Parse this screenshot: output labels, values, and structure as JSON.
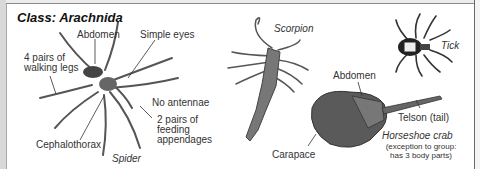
{
  "title": "Class: Arachnida",
  "spider": {
    "name": "Spider",
    "labels": {
      "abdomen": "Abdomen",
      "simple_eyes": "Simple eyes",
      "walking_legs_line1": "4 pairs of",
      "walking_legs_line2": "walking legs",
      "no_antennae": "No antennae",
      "feeding_line1": "2 pairs of",
      "feeding_line2": "feeding",
      "feeding_line3": "appendages",
      "cephalothorax": "Cephalothorax"
    }
  },
  "scorpion": {
    "name": "Scorpion"
  },
  "tick": {
    "name": "Tick"
  },
  "horseshoe_crab": {
    "name": "Horseshoe crab",
    "note_line1": "(exception to group:",
    "note_line2": "has 3 body parts)",
    "labels": {
      "abdomen": "Abdomen",
      "telson": "Telson (tail)",
      "carapace": "Carapace"
    }
  },
  "colors": {
    "frame": "#d9d9d9",
    "border": "#8a8a8a",
    "text": "#333333",
    "illustration": "#3a3a3a"
  }
}
